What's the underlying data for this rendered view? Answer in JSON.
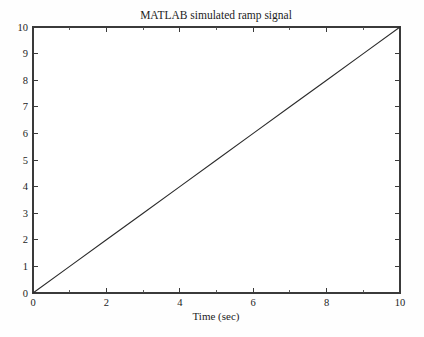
{
  "figure": {
    "background_color": "#fefefe",
    "plot_background_color": "#ffffff",
    "axis_color": "#3a3a3a",
    "line_color": "#2b2b2b"
  },
  "chart_data": {
    "type": "line",
    "title": "MATLAB simulated ramp signal",
    "xlabel": "Time (sec)",
    "ylabel": "",
    "xlim": [
      0,
      10
    ],
    "ylim": [
      0,
      10
    ],
    "grid": false,
    "legend": null,
    "x_ticks": [
      0,
      2,
      4,
      6,
      8,
      10
    ],
    "x_tick_labels": [
      "0",
      "2",
      "4",
      "6",
      "8",
      "10"
    ],
    "x_minor_ticks": [
      1,
      3,
      5,
      7,
      9
    ],
    "y_ticks": [
      0,
      1,
      2,
      3,
      4,
      5,
      6,
      7,
      8,
      9,
      10
    ],
    "y_tick_labels": [
      "0",
      "1",
      "2",
      "3",
      "4",
      "5",
      "6",
      "7",
      "8",
      "9",
      "10"
    ],
    "series": [
      {
        "name": "ramp",
        "x": [
          0,
          1,
          2,
          3,
          4,
          5,
          6,
          7,
          8,
          9,
          10
        ],
        "values": [
          0,
          1,
          2,
          3,
          4,
          5,
          6,
          7,
          8,
          9,
          10
        ]
      }
    ]
  }
}
